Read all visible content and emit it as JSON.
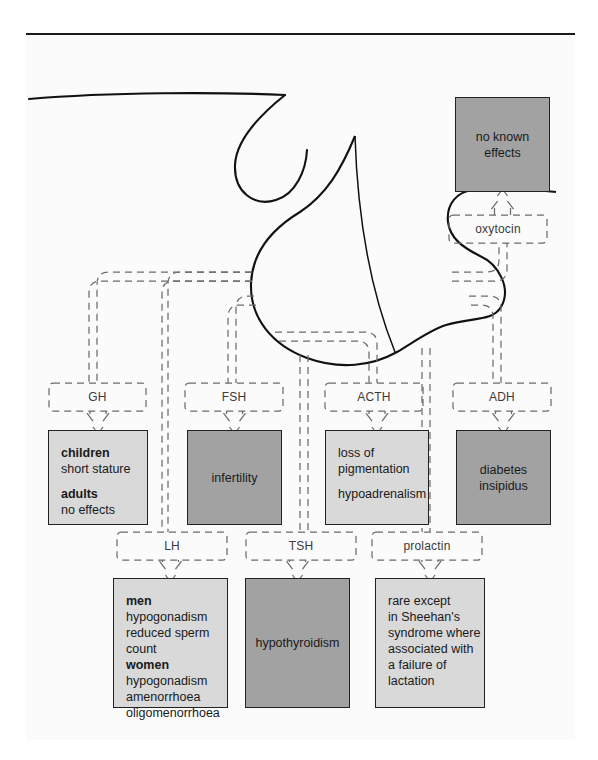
{
  "figure": {
    "frame_border_color": "#1a1a1a",
    "background": "#fbfbfb",
    "light_box_color": "#d9d9d9",
    "dark_box_color": "#a2a2a2"
  },
  "gland": {
    "name": "pituitary-gland",
    "label": ""
  },
  "hormones": [
    {
      "id": "oxytocin",
      "label": "oxytocin",
      "chip": {
        "x": 449,
        "y": 215,
        "w": 98,
        "h": 28
      }
    },
    {
      "id": "gh",
      "label": "GH",
      "chip": {
        "x": 49,
        "y": 383,
        "w": 97,
        "h": 28
      }
    },
    {
      "id": "fsh",
      "label": "FSH",
      "chip": {
        "x": 185,
        "y": 383,
        "w": 98,
        "h": 28
      }
    },
    {
      "id": "acth",
      "label": "ACTH",
      "chip": {
        "x": 325,
        "y": 383,
        "w": 98,
        "h": 28
      }
    },
    {
      "id": "adh",
      "label": "ADH",
      "chip": {
        "x": 453,
        "y": 383,
        "w": 98,
        "h": 28
      }
    },
    {
      "id": "lh",
      "label": "LH",
      "chip": {
        "x": 117,
        "y": 532,
        "w": 110,
        "h": 28
      }
    },
    {
      "id": "tsh",
      "label": "TSH",
      "chip": {
        "x": 246,
        "y": 532,
        "w": 110,
        "h": 28
      }
    },
    {
      "id": "prolactin",
      "label": "prolactin",
      "chip": {
        "x": 372,
        "y": 532,
        "w": 110,
        "h": 28
      }
    }
  ],
  "effects": [
    {
      "id": "oxytocin-effects",
      "hormone": "oxytocin",
      "shade": "dark",
      "align": "center",
      "box": {
        "x": 455,
        "y": 97,
        "w": 95,
        "h": 95
      },
      "lines": [
        {
          "text": "no known",
          "bold": false
        },
        {
          "text": "effects",
          "bold": false
        }
      ]
    },
    {
      "id": "gh-effects",
      "hormone": "gh",
      "shade": "light",
      "align": "left",
      "box": {
        "x": 48,
        "y": 430,
        "w": 100,
        "h": 95
      },
      "lines": [
        {
          "text": "children",
          "bold": true
        },
        {
          "text": "short stature",
          "bold": false
        },
        {
          "text": "",
          "bold": false,
          "spacer": true
        },
        {
          "text": "adults",
          "bold": true
        },
        {
          "text": "no effects",
          "bold": false
        }
      ]
    },
    {
      "id": "fsh-effects",
      "hormone": "fsh",
      "shade": "dark",
      "align": "center",
      "box": {
        "x": 187,
        "y": 430,
        "w": 95,
        "h": 95
      },
      "lines": [
        {
          "text": "infertility",
          "bold": false
        }
      ]
    },
    {
      "id": "acth-effects",
      "hormone": "acth",
      "shade": "light",
      "align": "left",
      "box": {
        "x": 325,
        "y": 430,
        "w": 104,
        "h": 95
      },
      "lines": [
        {
          "text": "loss of",
          "bold": false
        },
        {
          "text": "pigmentation",
          "bold": false
        },
        {
          "text": "",
          "bold": false,
          "spacer": true
        },
        {
          "text": "hypoadrenalism",
          "bold": false
        }
      ]
    },
    {
      "id": "adh-effects",
      "hormone": "adh",
      "shade": "dark",
      "align": "center",
      "box": {
        "x": 456,
        "y": 430,
        "w": 95,
        "h": 95
      },
      "lines": [
        {
          "text": "diabetes",
          "bold": false
        },
        {
          "text": "insipidus",
          "bold": false
        }
      ]
    },
    {
      "id": "lh-effects",
      "hormone": "lh",
      "shade": "light",
      "align": "left",
      "box": {
        "x": 113,
        "y": 578,
        "w": 115,
        "h": 130
      },
      "lines": [
        {
          "text": "men",
          "bold": true
        },
        {
          "text": "hypogonadism",
          "bold": false
        },
        {
          "text": "reduced sperm",
          "bold": false
        },
        {
          "text": "count",
          "bold": false
        },
        {
          "text": "women",
          "bold": true
        },
        {
          "text": "hypogonadism",
          "bold": false
        },
        {
          "text": "amenorrhoea",
          "bold": false
        },
        {
          "text": "oligomenorrhoea",
          "bold": false
        }
      ]
    },
    {
      "id": "tsh-effects",
      "hormone": "tsh",
      "shade": "dark",
      "align": "center",
      "box": {
        "x": 245,
        "y": 578,
        "w": 105,
        "h": 130
      },
      "lines": [
        {
          "text": "hypothyroidism",
          "bold": false
        }
      ]
    },
    {
      "id": "prolactin-effects",
      "hormone": "prolactin",
      "shade": "light",
      "align": "left",
      "box": {
        "x": 375,
        "y": 578,
        "w": 110,
        "h": 130
      },
      "lines": [
        {
          "text": "rare except",
          "bold": false
        },
        {
          "text": "in Sheehan's",
          "bold": false
        },
        {
          "text": "syndrome where",
          "bold": false
        },
        {
          "text": "associated with",
          "bold": false
        },
        {
          "text": "a failure of",
          "bold": false
        },
        {
          "text": "lactation",
          "bold": false
        }
      ]
    }
  ]
}
